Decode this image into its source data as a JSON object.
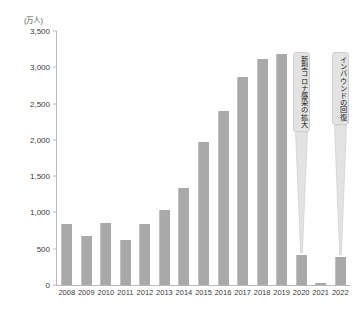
{
  "chart_data": {
    "type": "bar",
    "title": "",
    "subtitle": "",
    "unit_label": "(万人)",
    "xlabel": "",
    "ylabel": "",
    "ylim": [
      0,
      3500
    ],
    "ytick_values": [
      0,
      500,
      1000,
      1500,
      2000,
      2500,
      3000,
      3500
    ],
    "ytick_labels": [
      "0",
      "500",
      "1,000",
      "1,500",
      "2,000",
      "2,500",
      "3,000",
      "3,500"
    ],
    "grid": false,
    "legend": null,
    "categories": [
      "2008",
      "2009",
      "2010",
      "2011",
      "2012",
      "2013",
      "2014",
      "2015",
      "2016",
      "2017",
      "2018",
      "2019",
      "2020",
      "2021",
      "2022"
    ],
    "values": [
      835,
      679,
      861,
      622,
      836,
      1036,
      1341,
      1974,
      2404,
      2869,
      3119,
      3188,
      412,
      25,
      383
    ],
    "bar_color": "#a9a9a9",
    "axis_color": "#b9b9b9",
    "annotations": [
      {
        "name": "covid-callout",
        "text": "新型コロナ感染の拡大",
        "target_category": "2020",
        "orientation": "vertical"
      },
      {
        "name": "inbound-recovery-callout",
        "text": "インバウンドの回復",
        "target_category": "2022",
        "orientation": "vertical"
      }
    ]
  }
}
